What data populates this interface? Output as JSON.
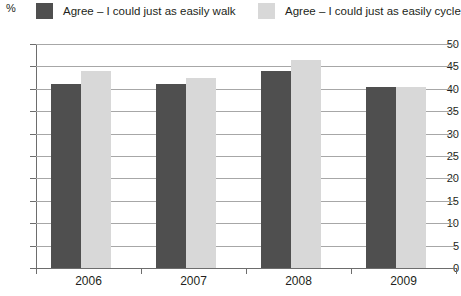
{
  "chart_data": {
    "type": "bar",
    "title": "",
    "subtitle": "",
    "xlabel": "",
    "ylabel": "%",
    "ylim": [
      0,
      50
    ],
    "ytick_step": 5,
    "yticks": [
      "50",
      "45",
      "40",
      "35",
      "30",
      "25",
      "20",
      "15",
      "10",
      "5",
      "0"
    ],
    "grid": true,
    "legend_position": "top",
    "categories": [
      "2006",
      "2007",
      "2008",
      "2009"
    ],
    "series": [
      {
        "name": "Agree – I could just as easily walk",
        "color": "#4f4f4f",
        "values": [
          41,
          41,
          44,
          40.5
        ]
      },
      {
        "name": "Agree – I could just as easily cycle",
        "color": "#d8d8d8",
        "values": [
          44,
          42.5,
          46.5,
          40.5
        ]
      }
    ]
  },
  "axis": {
    "unit_label": "%"
  }
}
